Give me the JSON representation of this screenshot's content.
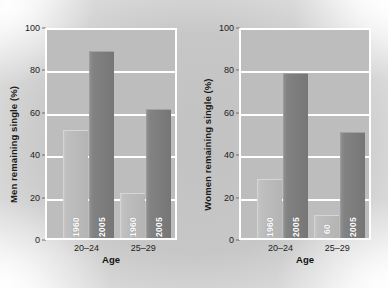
{
  "figure": {
    "background_color": "#c7c7c7",
    "plot_background_color": "#bdbdbd",
    "gridline_color": "#ffffff",
    "panel_border_color": "#ffffff"
  },
  "chart_data": [
    {
      "type": "bar",
      "title": "",
      "xlabel": "Age",
      "ylabel": "Men remaining single (%)",
      "categories": [
        "20–24",
        "25–29"
      ],
      "ylim": [
        0,
        100
      ],
      "yticks": [
        0,
        20,
        40,
        60,
        80,
        100
      ],
      "ytick_labels": [
        "0",
        "20",
        "40",
        "60",
        "80",
        "100"
      ],
      "grid": true,
      "legend": "none",
      "series": [
        {
          "name": "1960",
          "label": "1960",
          "color": "#bfbfbf",
          "values": [
            51,
            21
          ]
        },
        {
          "name": "2005",
          "label": "2005",
          "color": "#828282",
          "values": [
            88,
            61
          ]
        }
      ],
      "bar_labels": [
        [
          "1960",
          "2005"
        ],
        [
          "1960",
          "2005"
        ]
      ]
    },
    {
      "type": "bar",
      "title": "",
      "xlabel": "Age",
      "ylabel": "Women remaining single (%)",
      "categories": [
        "20–24",
        "25–29"
      ],
      "ylim": [
        0,
        100
      ],
      "yticks": [
        0,
        20,
        40,
        60,
        80,
        100
      ],
      "ytick_labels": [
        "0",
        "20",
        "40",
        "60",
        "80",
        "100"
      ],
      "grid": true,
      "legend": "none",
      "series": [
        {
          "name": "1960",
          "label": "1960",
          "color": "#bfbfbf",
          "values": [
            28,
            11
          ]
        },
        {
          "name": "2005",
          "label": "2005",
          "color": "#828282",
          "values": [
            78,
            50
          ]
        }
      ],
      "bar_labels": [
        [
          "1960",
          "2005"
        ],
        [
          "60",
          "2005"
        ]
      ]
    }
  ],
  "panels": {
    "left": {
      "ylabel": "Men remaining single (%)",
      "xlabel": "Age",
      "ytick_labels": [
        "100",
        "80",
        "60",
        "40",
        "20",
        "0"
      ],
      "categories": [
        "20–24",
        "25–29"
      ],
      "bars": [
        {
          "label": "1960",
          "value": 51,
          "style": "light"
        },
        {
          "label": "2005",
          "value": 88,
          "style": "dark"
        },
        {
          "label": "1960",
          "value": 21,
          "style": "light"
        },
        {
          "label": "2005",
          "value": 61,
          "style": "dark"
        }
      ]
    },
    "right": {
      "ylabel": "Women remaining single (%)",
      "xlabel": "Age",
      "ytick_labels": [
        "100",
        "80",
        "60",
        "40",
        "20",
        "0"
      ],
      "categories": [
        "20–24",
        "25–29"
      ],
      "bars": [
        {
          "label": "1960",
          "value": 28,
          "style": "light"
        },
        {
          "label": "2005",
          "value": 78,
          "style": "dark"
        },
        {
          "label": "60",
          "value": 11,
          "style": "light"
        },
        {
          "label": "2005",
          "value": 50,
          "style": "dark"
        }
      ]
    }
  }
}
